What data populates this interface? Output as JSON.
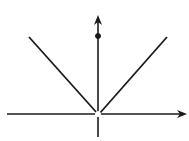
{
  "diagram": {
    "type": "function-graph",
    "colors": {
      "stroke": "#1a1a1a",
      "background": "#ffffff"
    },
    "axes": {
      "x_axis": {
        "x1": 7,
        "y": 114,
        "x2": 187,
        "arrow": "right"
      },
      "y_axis": {
        "x": 98,
        "y1": 137,
        "y2": 15,
        "arrow": "up"
      }
    },
    "lines": [
      {
        "name": "left-branch",
        "x1": 29,
        "y1": 37,
        "x2": 97,
        "y2": 113
      },
      {
        "name": "right-branch",
        "x1": 167,
        "y1": 37,
        "x2": 100,
        "y2": 113
      }
    ],
    "points": [
      {
        "name": "filled-point-y-axis",
        "cx": 98,
        "cy": 36,
        "r": 2.5,
        "filled": true
      },
      {
        "name": "open-point-origin",
        "cx": 98,
        "cy": 114,
        "r": 2.5,
        "filled": false
      }
    ]
  }
}
